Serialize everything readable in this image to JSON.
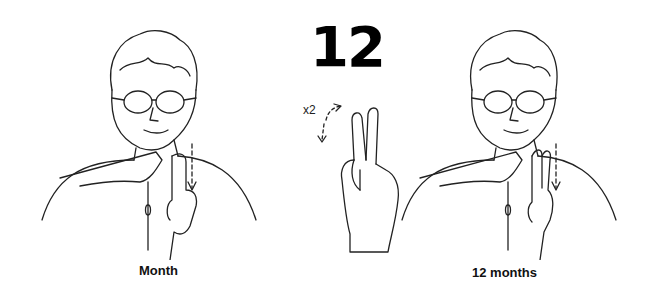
{
  "title_number": "12",
  "repetition_label": "x2",
  "panels": [
    {
      "id": "month",
      "caption": "Month"
    },
    {
      "id": "handshape",
      "caption": ""
    },
    {
      "id": "twelve-months",
      "caption": "12 months"
    }
  ],
  "captions": {
    "left": "Month",
    "right": "12 months"
  }
}
